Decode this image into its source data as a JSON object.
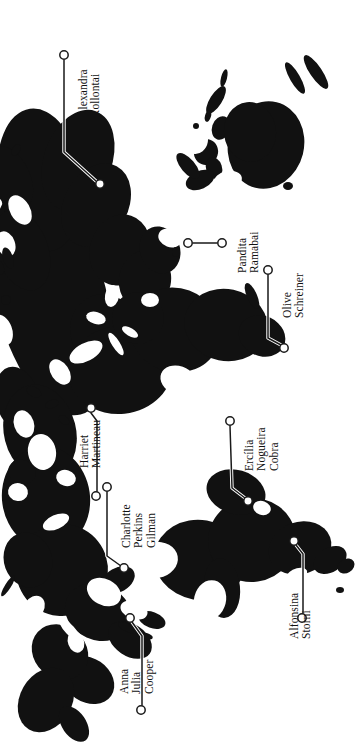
{
  "figure": {
    "type": "map",
    "background_color": "#ffffff",
    "land_color": "#111111",
    "leader_line_color": "#1a1a1a",
    "marker_fill_color": "#ffffff",
    "rotation_degrees": -90,
    "width": 364,
    "height": 756
  },
  "annotations": [
    {
      "id": "alexandra-kollontai",
      "lines": [
        "Alexandra",
        "Kollontai"
      ],
      "text": "Alexandra Kollontai",
      "label_x": 77,
      "label_y": 118,
      "label_align": "left",
      "anchor_marker": {
        "x": 64,
        "y": 55
      },
      "pin_marker": {
        "x": 100,
        "y": 184
      },
      "leader_path": "M64,60 L64,152 L96,181"
    },
    {
      "id": "pandita-ramabai",
      "lines": [
        "Pandita",
        "Ramabai"
      ],
      "text": "Pandita Ramabai",
      "label_x": 236,
      "label_y": 273,
      "label_align": "left",
      "anchor_marker": {
        "x": 222,
        "y": 243
      },
      "pin_marker": {
        "x": 188,
        "y": 243
      },
      "leader_path": "M217,243 L193,243"
    },
    {
      "id": "olive-schreiner",
      "lines": [
        "Olive",
        "Schreiner"
      ],
      "text": "Olive Schreiner",
      "label_x": 281,
      "label_y": 318,
      "label_align": "left",
      "anchor_marker": {
        "x": 268,
        "y": 270
      },
      "pin_marker": {
        "x": 284,
        "y": 348
      },
      "leader_path": "M268,275 L268,338 L281,345"
    },
    {
      "id": "harriet-martineau",
      "lines": [
        "Harriet",
        "Martineau"
      ],
      "text": "Harriet Martineau",
      "label_x": 78,
      "label_y": 468,
      "label_align": "left",
      "anchor_marker": {
        "x": 91,
        "y": 408
      },
      "pin_marker": {
        "x": 96,
        "y": 496
      },
      "leader_path": "M91,413 L97,421 L97,491"
    },
    {
      "id": "charlotte-perkins-gilman",
      "lines": [
        "Charlotte",
        "Perkins",
        "Gilman"
      ],
      "text": "Charlotte Perkins Gilman",
      "label_x": 120,
      "label_y": 548,
      "label_align": "left",
      "anchor_marker": {
        "x": 107,
        "y": 487
      },
      "pin_marker": {
        "x": 124,
        "y": 568
      },
      "leader_path": "M107,492 L107,556 L121,566"
    },
    {
      "id": "ercilia-nogueira-cobra",
      "lines": [
        "Ercília",
        "Nogueira",
        "Cobra"
      ],
      "text": "Ercília Nogueira Cobra",
      "label_x": 243,
      "label_y": 471,
      "label_align": "left",
      "anchor_marker": {
        "x": 230,
        "y": 421
      },
      "pin_marker": {
        "x": 248,
        "y": 501
      },
      "leader_path": "M230,426 L232,488 L245,498"
    },
    {
      "id": "alfonsina-storni",
      "lines": [
        "Alfonsina",
        "Storni"
      ],
      "text": "Alfonsina Storni",
      "label_x": 288,
      "label_y": 639,
      "label_align": "left",
      "anchor_marker": {
        "x": 294,
        "y": 541
      },
      "pin_marker": {
        "x": 302,
        "y": 618
      },
      "leader_path": "M296,545 L303,554 L303,613"
    },
    {
      "id": "anna-julia-cooper",
      "lines": [
        "Anna",
        "Julia",
        "Cooper"
      ],
      "text": "Anna Julia Cooper",
      "label_x": 118,
      "label_y": 694,
      "label_align": "left",
      "anchor_marker": {
        "x": 130,
        "y": 618
      },
      "pin_marker": {
        "x": 141,
        "y": 710
      },
      "leader_path": "M132,622 L142,636 L142,705"
    }
  ]
}
